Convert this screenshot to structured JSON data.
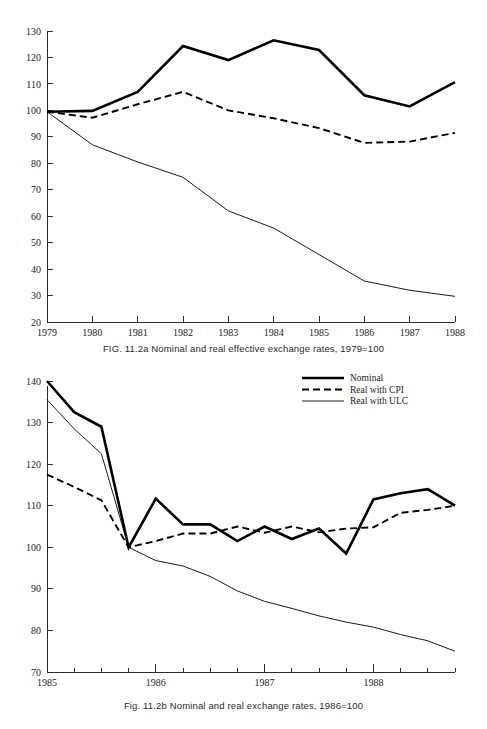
{
  "document": {
    "kind": "book-figure-page",
    "figures": 2
  },
  "figure_a": {
    "caption": "FIG. 11.2a  Nominal and real effective exchange rates, 1979=100"
  },
  "figure_b": {
    "caption": "Fig. 11.2b  Nominal and real exchange rates, 1986=100"
  },
  "legend": {
    "position": "top-right of figure b",
    "items": [
      {
        "label": "Nominal",
        "style": "thick-solid",
        "color": "#000000"
      },
      {
        "label": "Real with CPI",
        "style": "dashed",
        "color": "#000000"
      },
      {
        "label": "Real with ULC",
        "style": "thin-solid",
        "color": "#000000"
      }
    ]
  },
  "chart_data": [
    {
      "id": "fig-11-2a",
      "type": "line",
      "title": "FIG. 11.2a  Nominal and real effective exchange rates, 1979=100",
      "xlabel": "",
      "ylabel": "",
      "grid": false,
      "xlim": [
        1979,
        1988
      ],
      "ylim": [
        20,
        130
      ],
      "yticks": [
        20,
        30,
        40,
        50,
        60,
        70,
        80,
        90,
        100,
        110,
        120,
        130
      ],
      "categories": [
        "1979",
        "1980",
        "1981",
        "1982",
        "1983",
        "1984",
        "1985",
        "1986",
        "1987",
        "1988"
      ],
      "x": [
        1979,
        1980,
        1981,
        1982,
        1983,
        1984,
        1985,
        1986,
        1987,
        1988
      ],
      "series": [
        {
          "name": "Nominal",
          "style": "thick-solid",
          "values": [
            99.5,
            99.8,
            107.0,
            124.3,
            119.0,
            126.5,
            122.8,
            105.7,
            101.5,
            110.7
          ]
        },
        {
          "name": "Real with CPI",
          "style": "dashed",
          "values": [
            99.5,
            97.2,
            102.3,
            107.0,
            100.0,
            97.0,
            93.3,
            87.7,
            88.2,
            91.5
          ]
        },
        {
          "name": "Real with ULC",
          "style": "thin-solid",
          "values": [
            99.5,
            87.0,
            80.5,
            74.7,
            62.0,
            55.5,
            45.5,
            35.5,
            32.0,
            29.7
          ]
        }
      ]
    },
    {
      "id": "fig-11-2b",
      "type": "line",
      "title": "Fig. 11.2b  Nominal and real exchange rates, 1986=100",
      "xlabel": "",
      "ylabel": "",
      "grid": false,
      "xlim": [
        1985.0,
        1988.75
      ],
      "ylim": [
        70,
        140
      ],
      "yticks": [
        70,
        80,
        90,
        100,
        110,
        120,
        130,
        140
      ],
      "xticks_major": [
        "1985",
        "1986",
        "1987",
        "1988"
      ],
      "x_quarters": [
        "1985Q1",
        "1985Q2",
        "1985Q3",
        "1985Q4",
        "1986Q1",
        "1986Q2",
        "1986Q3",
        "1986Q4",
        "1987Q1",
        "1987Q2",
        "1987Q3",
        "1987Q4",
        "1988Q1",
        "1988Q2",
        "1988Q3",
        "1988Q4"
      ],
      "series": [
        {
          "name": "Nominal",
          "style": "thick-solid",
          "values": [
            140.0,
            132.5,
            129.0,
            100.0,
            111.7,
            105.5,
            105.5,
            101.5,
            105.0,
            102.0,
            104.5,
            98.5,
            111.5,
            113.0,
            114.0,
            110.0
          ]
        },
        {
          "name": "Real with CPI",
          "style": "dashed",
          "values": [
            117.5,
            114.5,
            111.3,
            100.0,
            101.5,
            103.3,
            103.3,
            105.0,
            103.5,
            105.0,
            103.6,
            104.5,
            104.8,
            108.3,
            109.0,
            110.0
          ]
        },
        {
          "name": "Real with ULC",
          "style": "thin-solid",
          "values": [
            135.5,
            128.5,
            122.5,
            100.0,
            96.8,
            95.5,
            93.0,
            89.5,
            87.0,
            85.3,
            83.5,
            82.0,
            80.8,
            79.0,
            77.5,
            75.0
          ]
        }
      ]
    }
  ]
}
